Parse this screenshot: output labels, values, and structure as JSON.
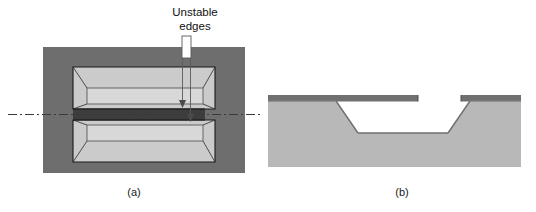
{
  "figure": {
    "type": "technical-diagram",
    "annotation": {
      "label_line_1": "Unstable",
      "label_line_2": "edges",
      "full_label": "Unstable edges",
      "leader": "double-arrow-callout"
    },
    "panels": [
      {
        "id": "a",
        "caption": "(a)",
        "view": "top-view",
        "description": "Plan view of two mirrored trapezoidal etch pits separated by a narrow dark beam slit, with a dash-dot section line through the center"
      },
      {
        "id": "b",
        "caption": "(b)",
        "view": "cross-section",
        "description": "Cross-section along the dash-dot line showing a thin film cantilever overhanging a trapezoidal etched cavity in the substrate"
      }
    ]
  },
  "colors": {
    "background": "#ffffff",
    "substrate_dark": "#6e6e6e",
    "pit_light": "#cfcfcf",
    "substrate_light": "#b8b8b8",
    "film_dark": "#707070",
    "outline": "#1a1a1a",
    "centerline": "#3a3a3a",
    "callout_fill": "#ffffff",
    "callout_stroke": "#555555",
    "text": "#111111"
  }
}
